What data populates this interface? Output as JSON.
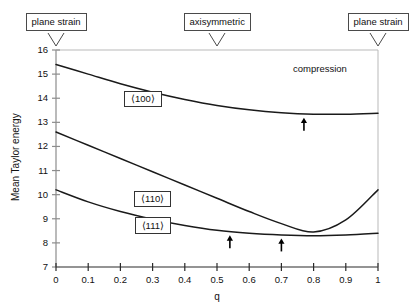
{
  "figure": {
    "background": "#ffffff",
    "line_color": "#1a1a1a",
    "axis_color": "#8c8c8c"
  },
  "callouts": [
    {
      "id": "left-plane-strain",
      "label": "plane strain",
      "q": 0.0
    },
    {
      "id": "axisymmetric",
      "label": "axisymmetric",
      "q": 0.5
    },
    {
      "id": "right-plane-strain",
      "label": "plane strain",
      "q": 1.0
    }
  ],
  "annotations": [
    {
      "id": "compression",
      "label": "compression",
      "q": 0.82,
      "y": 15.2
    }
  ],
  "curve_labels": [
    {
      "id": "label-100",
      "label": "⟨100⟩",
      "q": 0.27,
      "y": 13.95
    },
    {
      "id": "label-110",
      "label": "⟨110⟩",
      "q": 0.3,
      "y": 9.8
    },
    {
      "id": "label-111",
      "label": "⟨111⟩",
      "q": 0.3,
      "y": 8.72
    }
  ],
  "chart_data": {
    "type": "line",
    "title": "",
    "subtitle": "",
    "xlabel": "q",
    "ylabel": "Mean Taylor energy",
    "xlim": [
      0,
      1
    ],
    "ylim": [
      7,
      16
    ],
    "grid": false,
    "legend": "none",
    "x_ticks": [
      "0",
      "0.1",
      "0.2",
      "0.3",
      "0.4",
      "0.5",
      "0.6",
      "0.7",
      "0.8",
      "0.9",
      "1"
    ],
    "x_tick_values": [
      0,
      0.1,
      0.2,
      0.3,
      0.4,
      0.5,
      0.6,
      0.7,
      0.8,
      0.9,
      1
    ],
    "y_ticks": [
      "7",
      "8",
      "9",
      "10",
      "11",
      "12",
      "13",
      "14",
      "15",
      "16"
    ],
    "y_tick_values": [
      7,
      8,
      9,
      10,
      11,
      12,
      13,
      14,
      15,
      16
    ],
    "x": [
      0,
      0.1,
      0.2,
      0.3,
      0.4,
      0.5,
      0.6,
      0.7,
      0.8,
      0.9,
      1
    ],
    "series": [
      {
        "name": "⟨100⟩",
        "values": [
          15.4,
          15.0,
          14.6,
          14.25,
          13.95,
          13.7,
          13.52,
          13.4,
          13.34,
          13.34,
          13.38
        ]
      },
      {
        "name": "⟨110⟩",
        "values": [
          12.6,
          12.05,
          11.5,
          10.95,
          10.4,
          9.85,
          9.3,
          8.8,
          8.45,
          8.95,
          10.2
        ]
      },
      {
        "name": "⟨111⟩",
        "values": [
          10.2,
          9.7,
          9.3,
          8.98,
          8.72,
          8.52,
          8.4,
          8.33,
          8.3,
          8.33,
          8.4
        ]
      }
    ],
    "markers": [
      {
        "id": "arrow-upper",
        "type": "arrow-up",
        "q": 0.77,
        "y": 13.34,
        "series": "⟨100⟩"
      },
      {
        "id": "arrow-left",
        "type": "arrow-up",
        "q": 0.54,
        "y": 8.46,
        "series": "⟨111⟩"
      },
      {
        "id": "arrow-right",
        "type": "arrow-up",
        "q": 0.7,
        "y": 8.33,
        "series": "⟨111⟩"
      }
    ]
  }
}
